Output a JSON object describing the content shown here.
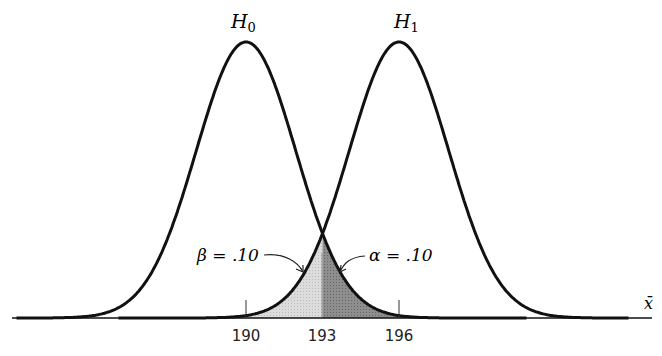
{
  "chart_data": {
    "type": "line",
    "title": "",
    "xlabel": "x̄",
    "ylabel": "",
    "grid": false,
    "series": [
      {
        "name": "H0",
        "label": "H",
        "sub": "0",
        "mean": 190,
        "sd": 1.95
      },
      {
        "name": "H1",
        "label": "H",
        "sub": "1",
        "mean": 196,
        "sd": 1.95
      }
    ],
    "ticks": [
      "190",
      "193",
      "196"
    ],
    "tick_values": [
      190,
      193,
      196
    ],
    "critical_value": 193,
    "annotations": [
      {
        "text": "β = .10",
        "region": "left of 193 under H1",
        "value": 0.1
      },
      {
        "text": "α = .10",
        "region": "right of 193 under H0",
        "value": 0.1
      }
    ],
    "xlim": [
      181,
      205
    ]
  },
  "labels": {
    "h0_main": "H",
    "h0_sub": "0",
    "h1_main": "H",
    "h1_sub": "1",
    "beta": "β = .10",
    "alpha": "α = .10",
    "xaxis": "x̄",
    "tick190": "190",
    "tick193": "193",
    "tick196": "196"
  },
  "colors": {
    "curve": "#111111",
    "beta_fill": "#d6d6d6",
    "alpha_fill": "#8a8a8a"
  }
}
